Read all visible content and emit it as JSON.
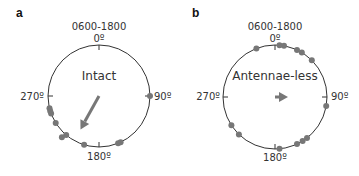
{
  "chart_data": [
    {
      "type": "scatter",
      "subtype": "circular",
      "panel_label": "a",
      "time_window": "0600-1800",
      "condition": "Intact",
      "tick_labels": {
        "top": "0º",
        "right": "90º",
        "bottom": "180º",
        "left": "270º"
      },
      "point_angles_deg": [
        90,
        155,
        158,
        197,
        220,
        222,
        238,
        250,
        253,
        256
      ],
      "mean_vector": {
        "angle_deg": 209,
        "length": 0.75
      }
    },
    {
      "type": "scatter",
      "subtype": "circular",
      "panel_label": "b",
      "time_window": "0600-1800",
      "condition": "Antennae-less",
      "tick_labels": {
        "top": "0º",
        "right": "90º",
        "bottom": "180º",
        "left": "270º"
      },
      "point_angles_deg": [
        339,
        5,
        10,
        25,
        31,
        45,
        100,
        142,
        148,
        155,
        175,
        224,
        237
      ],
      "mean_vector": {
        "angle_deg": 90,
        "length": 0.25
      }
    }
  ],
  "colors": {
    "points": "#777777",
    "circle": "#333333",
    "arrow": "#777777"
  }
}
